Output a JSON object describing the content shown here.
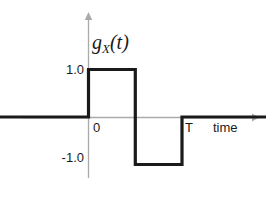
{
  "chart_data": {
    "type": "line",
    "title": "",
    "subtitle": "",
    "xlabel": "time",
    "ylabel": "",
    "series_label_base": "g",
    "series_label_subscript": "X",
    "series_label_argument": "(t)",
    "series": [
      {
        "name": "g_X(t)",
        "x": [
          -1.4,
          0,
          0,
          0.5,
          0.5,
          1.0,
          1.0,
          2.1
        ],
        "values": [
          0,
          0,
          1.0,
          1.0,
          -1.0,
          -1.0,
          0,
          0
        ]
      }
    ],
    "x_ticks": [
      {
        "value": 0,
        "label": "0"
      },
      {
        "value": 1.0,
        "label": "T"
      }
    ],
    "y_ticks": [
      {
        "value": 1.0,
        "label": "1.0"
      },
      {
        "value": -1.0,
        "label": "-1.0"
      }
    ],
    "xlim": [
      -1.4,
      2.4
    ],
    "ylim": [
      -1.6,
      2.1
    ],
    "grid": false,
    "legend": "none",
    "annotations": [],
    "colors": {
      "signal": "#1a1a1a",
      "axis": "#aaaaaa",
      "background": "#ffffff"
    }
  }
}
